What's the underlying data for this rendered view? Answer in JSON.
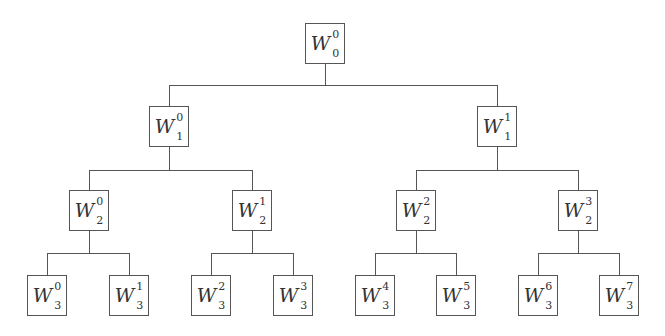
{
  "diagram": {
    "type": "binary-tree",
    "levels": 4,
    "colors": {
      "line": "#555555",
      "text": "#333333",
      "background": "#ffffff"
    },
    "nodes": [
      {
        "id": "W0_0",
        "base": "W",
        "sub": "0",
        "sup": "0",
        "level": 0,
        "cx": 325,
        "top": 23
      },
      {
        "id": "W1_0",
        "base": "W",
        "sub": "1",
        "sup": "0",
        "level": 1,
        "cx": 169,
        "top": 106
      },
      {
        "id": "W1_1",
        "base": "W",
        "sub": "1",
        "sup": "1",
        "level": 1,
        "cx": 497,
        "top": 106
      },
      {
        "id": "W2_0",
        "base": "W",
        "sub": "2",
        "sup": "0",
        "level": 2,
        "cx": 89,
        "top": 190
      },
      {
        "id": "W2_1",
        "base": "W",
        "sub": "2",
        "sup": "1",
        "level": 2,
        "cx": 252,
        "top": 190
      },
      {
        "id": "W2_2",
        "base": "W",
        "sub": "2",
        "sup": "2",
        "level": 2,
        "cx": 416,
        "top": 190
      },
      {
        "id": "W2_3",
        "base": "W",
        "sub": "2",
        "sup": "3",
        "level": 2,
        "cx": 578,
        "top": 190
      },
      {
        "id": "W3_0",
        "base": "W",
        "sub": "3",
        "sup": "0",
        "level": 3,
        "cx": 47,
        "top": 275
      },
      {
        "id": "W3_1",
        "base": "W",
        "sub": "3",
        "sup": "1",
        "level": 3,
        "cx": 129,
        "top": 275
      },
      {
        "id": "W3_2",
        "base": "W",
        "sub": "3",
        "sup": "2",
        "level": 3,
        "cx": 211,
        "top": 275
      },
      {
        "id": "W3_3",
        "base": "W",
        "sub": "3",
        "sup": "3",
        "level": 3,
        "cx": 293,
        "top": 275
      },
      {
        "id": "W3_4",
        "base": "W",
        "sub": "3",
        "sup": "4",
        "level": 3,
        "cx": 375,
        "top": 275
      },
      {
        "id": "W3_5",
        "base": "W",
        "sub": "3",
        "sup": "5",
        "level": 3,
        "cx": 456,
        "top": 275
      },
      {
        "id": "W3_6",
        "base": "W",
        "sub": "3",
        "sup": "6",
        "level": 3,
        "cx": 538,
        "top": 275
      },
      {
        "id": "W3_7",
        "base": "W",
        "sub": "3",
        "sup": "7",
        "level": 3,
        "cx": 619,
        "top": 275
      }
    ],
    "edges": [
      [
        "W0_0",
        "W1_0"
      ],
      [
        "W0_0",
        "W1_1"
      ],
      [
        "W1_0",
        "W2_0"
      ],
      [
        "W1_0",
        "W2_1"
      ],
      [
        "W1_1",
        "W2_2"
      ],
      [
        "W1_1",
        "W2_3"
      ],
      [
        "W2_0",
        "W3_0"
      ],
      [
        "W2_0",
        "W3_1"
      ],
      [
        "W2_1",
        "W3_2"
      ],
      [
        "W2_1",
        "W3_3"
      ],
      [
        "W2_2",
        "W3_4"
      ],
      [
        "W2_2",
        "W3_5"
      ],
      [
        "W2_3",
        "W3_6"
      ],
      [
        "W2_3",
        "W3_7"
      ]
    ],
    "connector_y": {
      "0": 85,
      "1": 170,
      "2": 253
    }
  }
}
